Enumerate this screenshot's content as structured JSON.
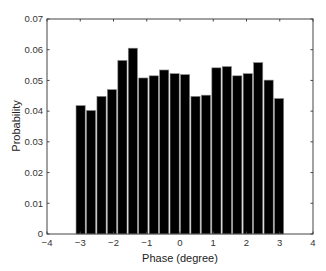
{
  "chart_data": {
    "type": "bar",
    "title": "",
    "xlabel": "Phase (degree)",
    "ylabel": "Probability",
    "xlim": [
      -4,
      4
    ],
    "ylim": [
      0,
      0.07
    ],
    "xticks": [
      -4,
      -3,
      -2,
      -1,
      0,
      1,
      2,
      3,
      4
    ],
    "xtick_labels": [
      "-4",
      "-3",
      "-2",
      "-1",
      "0",
      "1",
      "2",
      "3",
      "4"
    ],
    "yticks": [
      0,
      0.01,
      0.02,
      0.03,
      0.04,
      0.05,
      0.06,
      0.07
    ],
    "ytick_labels": [
      "0",
      "0.01",
      "0.02",
      "0.03",
      "0.04",
      "0.05",
      "0.06",
      "0.07"
    ],
    "grid": false,
    "legend": null,
    "bin_range": [
      -3.1416,
      3.1416
    ],
    "bin_count": 20,
    "x": [
      -2.985,
      -2.67,
      -2.356,
      -2.042,
      -1.728,
      -1.414,
      -1.1,
      -0.785,
      -0.471,
      -0.157,
      0.157,
      0.471,
      0.785,
      1.1,
      1.414,
      1.728,
      2.042,
      2.356,
      2.67,
      2.985
    ],
    "values": [
      0.0418,
      0.0402,
      0.0448,
      0.047,
      0.0565,
      0.0605,
      0.0508,
      0.0515,
      0.0534,
      0.0522,
      0.0519,
      0.0448,
      0.0452,
      0.0541,
      0.0545,
      0.0515,
      0.0522,
      0.0558,
      0.0501,
      0.0441
    ],
    "bar_color": "#000000",
    "bar_edge_color": "#888888"
  }
}
